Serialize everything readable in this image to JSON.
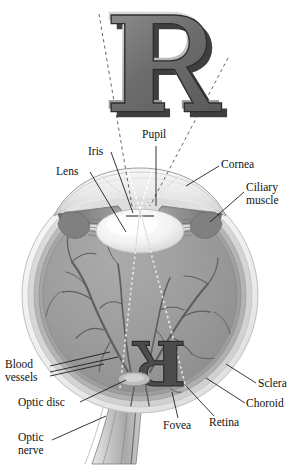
{
  "figure": {
    "object_letter": "R",
    "retinal_image_letter": "R",
    "retinal_image_note": "inverted and reversed"
  },
  "colors": {
    "page_background": "#ffffff",
    "letter_face": "#6e6e6e",
    "letter_top_highlight": "#b9b9b9",
    "letter_shadow": "#3c3c3c",
    "letter_outline": "#2b2b2b",
    "sclera_outer": "#f2f2f2",
    "sclera_mid": "#d8d8d8",
    "choroid": "#b6b6b6",
    "retina": "#a3a3a3",
    "vitreous": "#9b9b9b",
    "lens": "#f4f4f4",
    "cornea": "#e6e6e6",
    "iris": "#8a8a8a",
    "ciliary_muscle": "#7f7f7f",
    "vessel": "#5e5e5e",
    "optic_nerve": "#c9c9c9",
    "ray_line": "#ffffff",
    "projection_line": "#4a4a4a",
    "leader_line": "#1a1a1a",
    "label_text": "#111111"
  },
  "labels": [
    {
      "id": "pupil",
      "text": "Pupil",
      "x": 142,
      "y": 130,
      "align": "left"
    },
    {
      "id": "iris",
      "text": "Iris",
      "x": 88,
      "y": 148,
      "align": "left"
    },
    {
      "id": "lens",
      "text": "Lens",
      "x": 56,
      "y": 168,
      "align": "left"
    },
    {
      "id": "cornea",
      "text": "Cornea",
      "x": 221,
      "y": 160,
      "align": "left"
    },
    {
      "id": "ciliary-muscle",
      "text": "Ciliary\nmuscle",
      "x": 246,
      "y": 182,
      "align": "left"
    },
    {
      "id": "blood-vessels",
      "text": "Blood\nvessels",
      "x": 5,
      "y": 360,
      "align": "left"
    },
    {
      "id": "optic-disc",
      "text": "Optic disc",
      "x": 18,
      "y": 400,
      "align": "left"
    },
    {
      "id": "optic-nerve",
      "text": "Optic\nnerve",
      "x": 18,
      "y": 434,
      "align": "left"
    },
    {
      "id": "sclera",
      "text": "Sclera",
      "x": 258,
      "y": 379,
      "align": "left"
    },
    {
      "id": "choroid",
      "text": "Choroid",
      "x": 247,
      "y": 399,
      "align": "left"
    },
    {
      "id": "retina",
      "text": "Retina",
      "x": 209,
      "y": 418,
      "align": "left"
    },
    {
      "id": "fovea",
      "text": "Fovea",
      "x": 164,
      "y": 421,
      "align": "left"
    }
  ],
  "anatomy_parts": [
    "Cornea",
    "Iris",
    "Pupil",
    "Lens",
    "Ciliary muscle",
    "Sclera",
    "Choroid",
    "Retina",
    "Fovea",
    "Optic disc",
    "Optic nerve",
    "Blood vessels"
  ],
  "geometry": {
    "eyeball_center_x": 140,
    "eyeball_center_y": 295,
    "eyeball_rx": 118,
    "eyeball_ry": 118,
    "pupil_x": 140,
    "pupil_y": 207,
    "object_letter_box": {
      "x": 95,
      "y": 8,
      "w": 135,
      "h": 112
    },
    "image_letter_box": {
      "x": 118,
      "y": 352,
      "w": 72,
      "h": 38
    }
  }
}
